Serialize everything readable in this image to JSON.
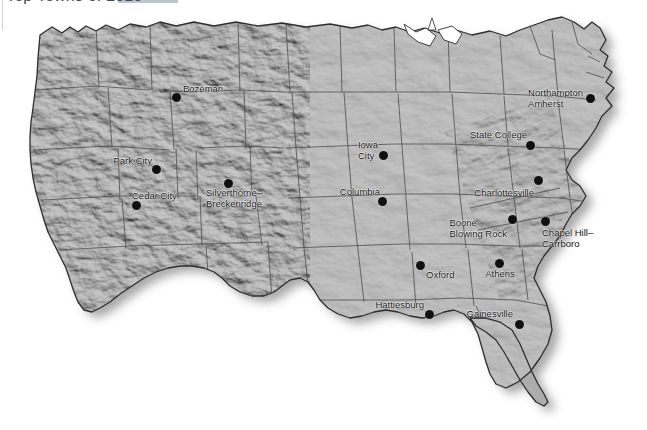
{
  "page": {
    "title": "Top Towns of 2010",
    "title_accent_color": "#b9c5d2",
    "background_color": "#ffffff"
  },
  "map": {
    "name": "united-states-shaded-relief-map",
    "projection_note": "contiguous United States",
    "land_fill": "#a9a9a9",
    "land_fill_light": "#c2c2c2",
    "state_border_color": "#4a4a4a",
    "coast_border_color": "#2b2b2b",
    "shadow_color": "rgba(60,60,60,0.45)",
    "dot_color": "#101010",
    "label_color": "#111111"
  },
  "cities": [
    {
      "name": "Bozeman",
      "label": "Bozeman",
      "dot_x": 176,
      "dot_y": 97,
      "label_x": 183,
      "label_y": 89,
      "align": "left",
      "lines": [
        "Bozeman"
      ]
    },
    {
      "name": "Park City",
      "label": "Park City",
      "dot_x": 156,
      "dot_y": 169,
      "label_x": 152,
      "label_y": 161,
      "align": "right",
      "lines": [
        "Park City"
      ]
    },
    {
      "name": "Cedar City",
      "label": "Cedar City",
      "dot_x": 136,
      "dot_y": 205,
      "label_x": 132,
      "label_y": 196,
      "align": "left",
      "lines": [
        "Cedar City"
      ]
    },
    {
      "name": "Silverthorne-Breckenridge",
      "label": "Silverthorne–Breckenridge",
      "dot_x": 228,
      "dot_y": 183,
      "label_x": 206,
      "label_y": 198,
      "align": "left",
      "lines": [
        "Silverthorne–",
        "Breckenridge"
      ]
    },
    {
      "name": "Iowa City",
      "label": "Iowa City",
      "dot_x": 383,
      "dot_y": 155,
      "label_x": 378,
      "label_y": 150,
      "align": "right",
      "lines": [
        "Iowa",
        "City"
      ]
    },
    {
      "name": "Columbia",
      "label": "Columbia",
      "dot_x": 382,
      "dot_y": 201,
      "label_x": 380,
      "label_y": 192,
      "align": "right",
      "lines": [
        "Columbia"
      ]
    },
    {
      "name": "Oxford",
      "label": "Oxford",
      "dot_x": 420,
      "dot_y": 265,
      "label_x": 426,
      "label_y": 275,
      "align": "left",
      "lines": [
        "Oxford"
      ]
    },
    {
      "name": "Hattiesburg",
      "label": "Hattiesburg",
      "dot_x": 429,
      "dot_y": 314,
      "label_x": 424,
      "label_y": 305,
      "align": "right",
      "lines": [
        "Hattiesburg"
      ]
    },
    {
      "name": "Athens",
      "label": "Athens",
      "dot_x": 499,
      "dot_y": 263,
      "label_x": 500,
      "label_y": 274,
      "align": "center",
      "lines": [
        "Athens"
      ]
    },
    {
      "name": "Gainesville",
      "label": "Gainesville",
      "dot_x": 519,
      "dot_y": 324,
      "label_x": 513,
      "label_y": 314,
      "align": "right",
      "lines": [
        "Gainesville"
      ]
    },
    {
      "name": "Chapel Hill-Carrboro",
      "label": "Chapel Hill–Carrboro",
      "dot_x": 545,
      "dot_y": 221,
      "label_x": 542,
      "label_y": 238,
      "align": "left",
      "lines": [
        "Chapel Hill–",
        "Carrboro"
      ]
    },
    {
      "name": "Boone Blowing Rock",
      "label": "Boone / Blowing Rock",
      "dot_x": 512,
      "dot_y": 219,
      "label_x": 507,
      "label_y": 228,
      "align": "right",
      "lines": [
        "Boone",
        "Blowing Rock"
      ]
    },
    {
      "name": "Charlottesville",
      "label": "Charlottesville",
      "dot_x": 538,
      "dot_y": 180,
      "label_x": 534,
      "label_y": 193,
      "align": "right",
      "lines": [
        "Charlottesville"
      ]
    },
    {
      "name": "State College",
      "label": "State College",
      "dot_x": 530,
      "dot_y": 145,
      "label_x": 527,
      "label_y": 135,
      "align": "right",
      "lines": [
        "State College"
      ]
    },
    {
      "name": "Northampton Amherst",
      "label": "Northampton / Amherst",
      "dot_x": 590,
      "dot_y": 98,
      "label_x": 583,
      "label_y": 98,
      "align": "right",
      "lines": [
        "Northampton",
        "Amherst"
      ]
    }
  ]
}
